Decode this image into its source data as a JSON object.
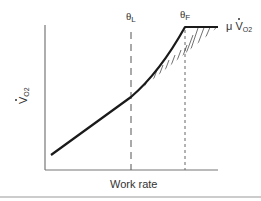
{
  "diagram": {
    "type": "physiology-schematic",
    "x_axis_label": "Work rate",
    "y_axis_label": {
      "main": "V",
      "sub": "O2"
    },
    "thresholds": [
      {
        "id": "theta-L",
        "symbol": "θ",
        "sub": "L",
        "style": "long-dash"
      },
      {
        "id": "theta-F",
        "symbol": "θ",
        "sub": "F",
        "style": "short-dash"
      }
    ],
    "plateau_label": {
      "prefix": "μ",
      "main": "V",
      "sub": "O2"
    },
    "curve": {
      "segments": [
        "linear below θL",
        "upward-curving between θL and θF",
        "plateau above θF"
      ],
      "hatched_region": "excess VO2 above linear projection between θL and θF"
    },
    "colors": {
      "line": "#1a1a1a",
      "axis": "#666666",
      "dash": "#555555"
    }
  }
}
